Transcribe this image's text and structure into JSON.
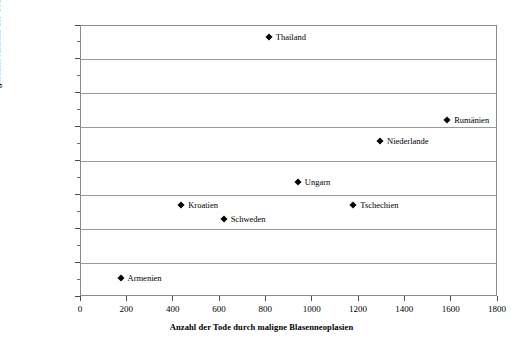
{
  "chart_data": {
    "type": "scatter",
    "title": "",
    "xlabel": "Anzahl der Tode durch maligne Blasenneoplasien",
    "ylabel": "gesamte Anzahl der Tode durch Neoplasien",
    "xlim": [
      0,
      1800
    ],
    "ylim": [
      0,
      80000
    ],
    "xticks": [
      0,
      200,
      400,
      600,
      800,
      1000,
      1200,
      1400,
      1600,
      1800
    ],
    "yticks": [
      0,
      10000,
      20000,
      30000,
      40000,
      50000,
      60000,
      70000,
      80000
    ],
    "xtick_labels": [
      "0",
      "200",
      "400",
      "600",
      "800",
      "1000",
      "1200",
      "1400",
      "1600",
      "1800"
    ],
    "ytick_labels": [
      "0",
      "10000",
      "20000",
      "30000",
      "40000",
      "50000",
      "60000",
      "70000",
      "80000"
    ],
    "y_minor_ticks": [
      5000,
      15000,
      25000,
      35000,
      45000,
      55000,
      65000,
      75000
    ],
    "grid": "horizontal",
    "grid_color": "#9a9a9a",
    "marker": "diamond",
    "marker_color": "#000000",
    "legend": "none",
    "points": [
      {
        "label": "Thailand",
        "x": 815,
        "y": 76400,
        "label_side": "right"
      },
      {
        "label": "Rumänien",
        "x": 1585,
        "y": 52100,
        "label_side": "right"
      },
      {
        "label": "Niederlande",
        "x": 1295,
        "y": 45700,
        "label_side": "right"
      },
      {
        "label": "Ungarn",
        "x": 940,
        "y": 33800,
        "label_side": "right"
      },
      {
        "label": "Kroatien",
        "x": 437,
        "y": 26800,
        "label_side": "right"
      },
      {
        "label": "Tschechien",
        "x": 1180,
        "y": 26800,
        "label_side": "right"
      },
      {
        "label": "Schweden",
        "x": 620,
        "y": 22700,
        "label_side": "right"
      },
      {
        "label": "Armenien",
        "x": 175,
        "y": 5400,
        "label_side": "right"
      }
    ]
  }
}
